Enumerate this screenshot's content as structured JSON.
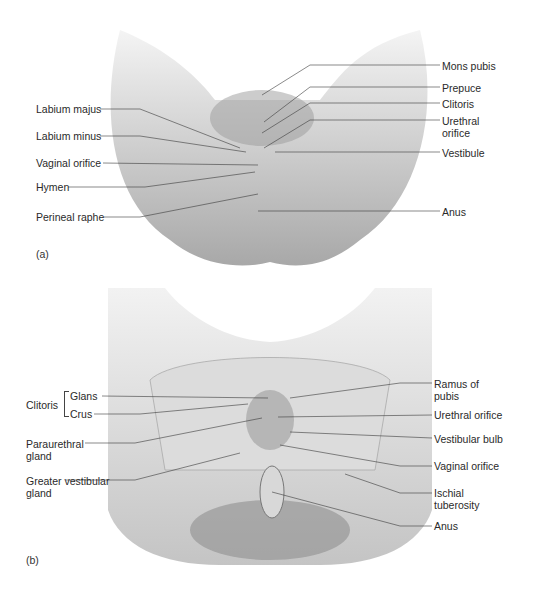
{
  "figure": {
    "panels": [
      {
        "id": "a",
        "tag": "(a)",
        "description": "External view of perineal region (illustration)",
        "labels_left": [
          {
            "text": "Labium majus",
            "x": 36,
            "y": 104
          },
          {
            "text": "Labium minus",
            "x": 36,
            "y": 131
          },
          {
            "text": "Vaginal orifice",
            "x": 36,
            "y": 157
          },
          {
            "text": "Hymen",
            "x": 36,
            "y": 182
          },
          {
            "text": "Perineal raphe",
            "x": 36,
            "y": 211
          }
        ],
        "labels_right": [
          {
            "text": "Mons pubis",
            "x": 442,
            "y": 60
          },
          {
            "text": "Prepuce",
            "x": 442,
            "y": 82
          },
          {
            "text": "Clitoris",
            "x": 442,
            "y": 98
          },
          {
            "text": "Urethral orifice",
            "x": 442,
            "y": 115
          },
          {
            "text": "Vestibule",
            "x": 442,
            "y": 147
          },
          {
            "text": "Anus",
            "x": 442,
            "y": 206
          }
        ]
      },
      {
        "id": "b",
        "tag": "(b)",
        "description": "Deep view showing pelvic bones and muscles (illustration)",
        "group_label": "Clitoris",
        "labels_left": [
          {
            "text": "Glans",
            "x": 70,
            "y": 390
          },
          {
            "text": "Crus",
            "x": 70,
            "y": 408
          },
          {
            "text": "Paraurethral gland",
            "x": 26,
            "y": 440
          },
          {
            "text": "Greater vestibular gland",
            "x": 26,
            "y": 477
          }
        ],
        "labels_right": [
          {
            "text": "Ramus of pubis",
            "x": 434,
            "y": 378
          },
          {
            "text": "Urethral orifice",
            "x": 434,
            "y": 409
          },
          {
            "text": "Vestibular bulb",
            "x": 434,
            "y": 433
          },
          {
            "text": "Vaginal orifice",
            "x": 434,
            "y": 460
          },
          {
            "text": "Ischial tuberosity",
            "x": 434,
            "y": 487
          },
          {
            "text": "Anus",
            "x": 434,
            "y": 520
          }
        ]
      }
    ],
    "colors": {
      "background": "#ffffff",
      "label_text": "#2a2a2a",
      "leader_line": "#3a3a3a",
      "illustration_light": "#e6e6e6",
      "illustration_mid": "#bdbdbd",
      "illustration_dark": "#8a8a8a"
    }
  }
}
